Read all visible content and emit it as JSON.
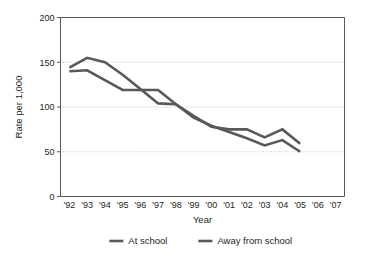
{
  "chart_data": {
    "type": "line",
    "title": "",
    "xlabel": "Year",
    "ylabel": "Rate per 1,000",
    "categories": [
      "'92",
      "'93",
      "'94",
      "'95",
      "'96",
      "'97",
      "'98",
      "'99",
      "'00",
      "'01",
      "'02",
      "'03",
      "'04",
      "'05",
      "'06",
      "'07"
    ],
    "x_tick_labels": [
      "'92",
      "'93",
      "'94",
      "'95",
      "'96",
      "'97",
      "'98",
      "'99",
      "'00",
      "'01",
      "'02",
      "'03",
      "'04",
      "'05",
      "'06",
      "'07"
    ],
    "y_tick_labels": [
      "0",
      "50",
      "100",
      "150",
      "200"
    ],
    "y_ticks": [
      0,
      50,
      100,
      150,
      200
    ],
    "ylim": [
      0,
      200
    ],
    "grid": "horizontal",
    "legend_position": "bottom",
    "series": [
      {
        "name": "At school",
        "color": "#58595b",
        "x": [
          "'92",
          "'93",
          "'94",
          "'95",
          "'96",
          "'97",
          "'98",
          "'99",
          "'00",
          "'01",
          "'02",
          "'03",
          "'04",
          "'05"
        ],
        "values": [
          140,
          141,
          130,
          119,
          119,
          119,
          103,
          90,
          78,
          75,
          75,
          66,
          75,
          59
        ]
      },
      {
        "name": "Away from school",
        "color": "#58595b",
        "x": [
          "'92",
          "'93",
          "'94",
          "'95",
          "'96",
          "'97",
          "'98",
          "'99",
          "'00",
          "'01",
          "'02",
          "'03",
          "'04",
          "'05"
        ],
        "values": [
          144,
          155,
          150,
          136,
          120,
          104,
          103,
          88,
          79,
          72,
          65,
          57,
          63,
          50
        ]
      }
    ]
  },
  "legend": {
    "items": [
      {
        "label": "At school"
      },
      {
        "label": "Away from school"
      }
    ]
  },
  "axes": {
    "y_axis_title": "Rate per 1,000",
    "x_axis_title": "Year"
  }
}
